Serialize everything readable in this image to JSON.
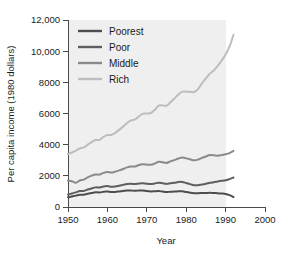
{
  "chart_data": {
    "type": "line",
    "title": "",
    "xlabel": "Year",
    "ylabel": "Per capita income (1980 dollars)",
    "xlim": [
      1950,
      2000
    ],
    "ylim": [
      0,
      12000
    ],
    "xticks": [
      1950,
      1960,
      1970,
      1980,
      1990,
      2000
    ],
    "xticklabels": [
      "1950",
      "1960",
      "1970",
      "1980",
      "1990",
      "2000"
    ],
    "yticks": [
      0,
      2000,
      4000,
      6000,
      8000,
      10000,
      12000
    ],
    "yticklabels": [
      "0",
      "2000",
      "4000",
      "6000",
      "8000",
      "10,000",
      "12,000"
    ],
    "grid": false,
    "legend_position": "upper-left-inside",
    "plot_background": "#efefef",
    "x": [
      1950,
      1951,
      1952,
      1953,
      1954,
      1955,
      1956,
      1957,
      1958,
      1959,
      1960,
      1961,
      1962,
      1963,
      1964,
      1965,
      1966,
      1967,
      1968,
      1969,
      1970,
      1971,
      1972,
      1973,
      1974,
      1975,
      1976,
      1977,
      1978,
      1979,
      1980,
      1981,
      1982,
      1983,
      1984,
      1985,
      1986,
      1987,
      1988,
      1989,
      1990,
      1991,
      1992
    ],
    "series": [
      {
        "name": "Poorest",
        "color": "#4d4d4d",
        "values": [
          620,
          680,
          730,
          790,
          790,
          850,
          900,
          950,
          930,
          980,
          990,
          960,
          970,
          1000,
          1030,
          1060,
          1060,
          1040,
          1060,
          1060,
          1020,
          1000,
          1010,
          1020,
          990,
          960,
          980,
          990,
          1010,
          1010,
          960,
          920,
          890,
          890,
          900,
          900,
          910,
          900,
          890,
          870,
          840,
          760,
          640
        ]
      },
      {
        "name": "Poor",
        "color": "#5e5e5e",
        "values": [
          800,
          870,
          940,
          1020,
          1030,
          1120,
          1190,
          1260,
          1250,
          1320,
          1340,
          1300,
          1320,
          1370,
          1420,
          1470,
          1490,
          1470,
          1510,
          1530,
          1490,
          1470,
          1510,
          1560,
          1530,
          1480,
          1520,
          1550,
          1600,
          1610,
          1540,
          1470,
          1400,
          1400,
          1450,
          1490,
          1550,
          1590,
          1640,
          1680,
          1710,
          1790,
          1890
        ]
      },
      {
        "name": "Middle",
        "color": "#8a8a8a",
        "values": [
          1700,
          1650,
          1560,
          1700,
          1760,
          1900,
          2010,
          2090,
          2080,
          2190,
          2250,
          2210,
          2270,
          2350,
          2440,
          2540,
          2600,
          2600,
          2690,
          2740,
          2720,
          2710,
          2790,
          2900,
          2870,
          2830,
          2930,
          3010,
          3110,
          3170,
          3120,
          3060,
          3000,
          3040,
          3150,
          3240,
          3330,
          3320,
          3290,
          3330,
          3380,
          3460,
          3600
        ]
      },
      {
        "name": "Rich",
        "color": "#bdbdbd",
        "values": [
          3400,
          3500,
          3620,
          3760,
          3820,
          4000,
          4170,
          4300,
          4310,
          4500,
          4620,
          4620,
          4760,
          4950,
          5160,
          5390,
          5560,
          5620,
          5820,
          5980,
          6000,
          6030,
          6230,
          6500,
          6520,
          6500,
          6720,
          6960,
          7220,
          7400,
          7400,
          7390,
          7380,
          7560,
          7940,
          8250,
          8560,
          8760,
          9050,
          9400,
          9780,
          10300,
          11050
        ]
      }
    ]
  },
  "legend": {
    "items": [
      {
        "label": "Poorest",
        "color": "#4d4d4d"
      },
      {
        "label": "Poor",
        "color": "#5e5e5e"
      },
      {
        "label": "Middle",
        "color": "#8a8a8a"
      },
      {
        "label": "Rich",
        "color": "#bdbdbd"
      }
    ]
  },
  "axes": {
    "x_title": "Year",
    "y_title": "Per capita income (1980 dollars)",
    "x_labels": [
      "1950",
      "1960",
      "1970",
      "1980",
      "1990",
      "2000"
    ],
    "y_labels": [
      "0",
      "2000",
      "4000",
      "6000",
      "8000",
      "10,000",
      "12,000"
    ]
  }
}
